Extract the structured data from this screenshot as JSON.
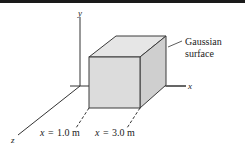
{
  "figure": {
    "type": "3d-axes-with-cube",
    "axes": {
      "x_label": "x",
      "y_label": "y",
      "z_label": "z"
    },
    "cube": {
      "label_line1": "Gaussian",
      "label_line2": "surface",
      "colors": {
        "front": "#dcdcdc",
        "top": "#e6e6e6",
        "side": "#cfcfcf",
        "edge": "#3a3a3a"
      }
    },
    "markers": [
      {
        "var": "x",
        "eq": "=",
        "value": "1.0 m"
      },
      {
        "var": "x",
        "eq": "=",
        "value": "3.0 m"
      }
    ]
  }
}
